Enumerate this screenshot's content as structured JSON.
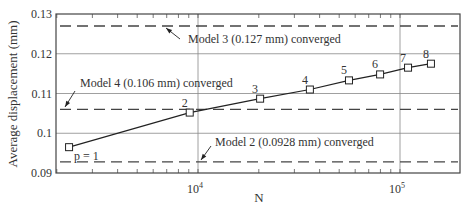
{
  "chart_data": {
    "type": "line",
    "title": "",
    "xlabel": "N",
    "ylabel": "Average displacement (mm)",
    "xscale": "log",
    "xlim": [
      2000,
      200000
    ],
    "ylim": [
      0.09,
      0.13
    ],
    "grid": true,
    "x_tick_labels": [
      "10^4",
      "10^5"
    ],
    "x_ticks": [
      10000,
      100000
    ],
    "y_tick_labels": [
      "0.09",
      "0.1",
      "0.11",
      "0.12",
      "0.13"
    ],
    "y_ticks": [
      0.09,
      0.1,
      0.11,
      0.12,
      0.13
    ],
    "series": [
      {
        "name": "Model (p-refinement)",
        "marker": "square",
        "point_labels": [
          "p = 1",
          "2",
          "3",
          "4",
          "5",
          "6",
          "7",
          "8"
        ],
        "x": [
          2300,
          9100,
          20300,
          35800,
          55900,
          79700,
          109600,
          142300
        ],
        "y": [
          0.0965,
          0.1052,
          0.1087,
          0.111,
          0.1133,
          0.1148,
          0.1165,
          0.1175
        ]
      }
    ],
    "reference_lines": [
      {
        "label": "Model 3 (0.127 mm) converged",
        "y": 0.127,
        "style": "dashed"
      },
      {
        "label": "Model 4 (0.106 mm) converged",
        "y": 0.106,
        "style": "dashed"
      },
      {
        "label": "Model 2 (0.0928 mm) converged",
        "y": 0.0928,
        "style": "dashed"
      }
    ]
  }
}
